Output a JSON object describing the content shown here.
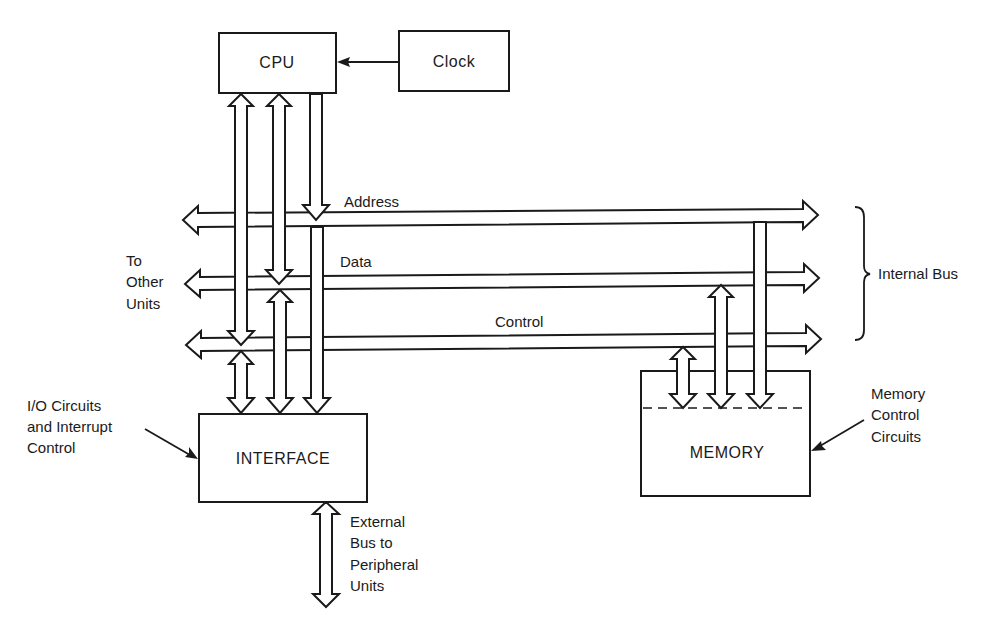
{
  "diagram": {
    "blocks": {
      "cpu": "CPU",
      "clock": "Clock",
      "interface": "INTERFACE",
      "memory": "MEMORY"
    },
    "buses": {
      "address": "Address",
      "data": "Data",
      "control": "Control"
    },
    "labels": {
      "to_other_units": [
        "To",
        "Other",
        "Units"
      ],
      "internal_bus": "Internal Bus",
      "io_circuits": [
        "I/O Circuits",
        "and Interrupt",
        "Control"
      ],
      "memory_control": [
        "Memory",
        "Control",
        "Circuits"
      ],
      "external_bus": [
        "External",
        "Bus to",
        "Peripheral",
        "Units"
      ]
    },
    "colors": {
      "ink": "#1a1a1a",
      "paper": "#ffffff"
    }
  }
}
